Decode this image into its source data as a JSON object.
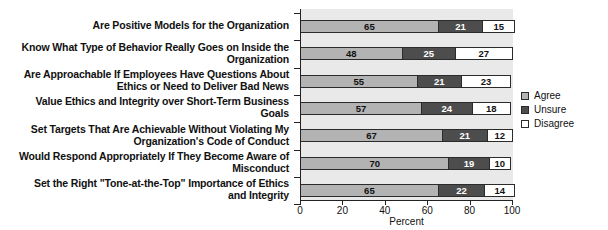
{
  "chart_data": {
    "type": "bar",
    "orientation": "horizontal",
    "stacked": true,
    "title": "",
    "xlabel": "Percent",
    "ylabel": "",
    "xlim": [
      0,
      100
    ],
    "xticks": [
      0,
      20,
      40,
      60,
      80,
      100
    ],
    "grid": false,
    "legend_position": "right",
    "categories": [
      "Are Positive Models for the Organization",
      "Know What Type of Behavior Really Goes on Inside the\nOrganization",
      "Are Approachable If Employees Have Questions About\nEthics or Need to Deliver Bad News",
      "Value Ethics and Integrity over Short-Term Business\nGoals",
      "Set Targets That Are Achievable Without Violating My\nOrganization's Code of Conduct",
      "Would Respond Appropriately If They Become Aware of\nMisconduct",
      "Set the Right \"Tone-at-the-Top\" Importance of Ethics\nand Integrity"
    ],
    "series": [
      {
        "name": "Agree",
        "color": "#b3b3b3",
        "values": [
          65,
          48,
          55,
          57,
          67,
          70,
          65
        ]
      },
      {
        "name": "Unsure",
        "color": "#4d4d4d",
        "values": [
          21,
          25,
          21,
          24,
          21,
          19,
          22
        ]
      },
      {
        "name": "Disagree",
        "color": "#ffffff",
        "values": [
          15,
          27,
          23,
          18,
          12,
          10,
          14
        ]
      }
    ]
  },
  "legend": {
    "items": [
      {
        "label": "Agree"
      },
      {
        "label": "Unsure"
      },
      {
        "label": "Disagree"
      }
    ]
  },
  "axis": {
    "x_title": "Percent",
    "x_tick_labels": [
      "0",
      "20",
      "40",
      "60",
      "80",
      "100"
    ]
  }
}
